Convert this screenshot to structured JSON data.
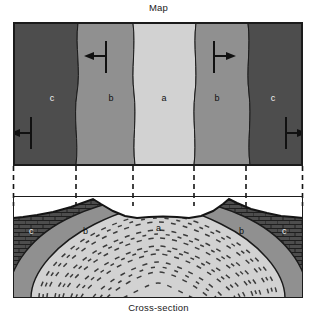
{
  "figure": {
    "map_title": "Map",
    "section_title": "Cross-section",
    "structure_type": "anticline"
  },
  "colors": {
    "unit_a": "#d2d2d2",
    "unit_b": "#909090",
    "unit_c": "#4d4d4d",
    "outline": "#1b1b1b",
    "background": "#ffffff",
    "bedding_tick": "#3c3c3c",
    "brick_line": "#2a2a2a"
  },
  "map": {
    "bands": [
      {
        "label": "c",
        "unit": "c",
        "color_key": "unit_c",
        "label_x": 51,
        "label_y": 96
      },
      {
        "label": "b",
        "unit": "b",
        "color_key": "unit_b",
        "label_x": 110,
        "label_y": 96
      },
      {
        "label": "a",
        "unit": "a",
        "color_key": "unit_a",
        "label_x": 163,
        "label_y": 96
      },
      {
        "label": "b",
        "unit": "b",
        "color_key": "unit_b",
        "label_x": 216,
        "label_y": 96
      },
      {
        "label": "c",
        "unit": "c",
        "color_key": "unit_c",
        "label_x": 272,
        "label_y": 96
      }
    ],
    "symbols": [
      {
        "name": "strike-dip-left-upper",
        "dip_direction": "left",
        "x": 105,
        "y": 52
      },
      {
        "name": "strike-dip-right-upper",
        "dip_direction": "right",
        "x": 213,
        "y": 52
      },
      {
        "name": "strike-dip-left-lower",
        "dip_direction": "left",
        "x": 28,
        "y": 128
      },
      {
        "name": "strike-dip-right-lower",
        "dip_direction": "right",
        "x": 290,
        "y": 128
      }
    ]
  },
  "tie_lines": {
    "count": 6,
    "x_positions": [
      13,
      76,
      133,
      194,
      246,
      303
    ]
  },
  "section": {
    "units": [
      {
        "label": "c",
        "unit": "c",
        "label_x": 22,
        "label_y": 36,
        "light_text": true
      },
      {
        "label": "b",
        "unit": "b",
        "label_x": 73,
        "label_y": 36,
        "light_text": false
      },
      {
        "label": "a",
        "unit": "a",
        "label_x": 158,
        "label_y": 35,
        "light_text": false
      },
      {
        "label": "b",
        "unit": "b",
        "label_x": 240,
        "label_y": 36,
        "light_text": false
      },
      {
        "label": "c",
        "unit": "c",
        "label_x": 281,
        "label_y": 36,
        "light_text": true
      }
    ]
  }
}
